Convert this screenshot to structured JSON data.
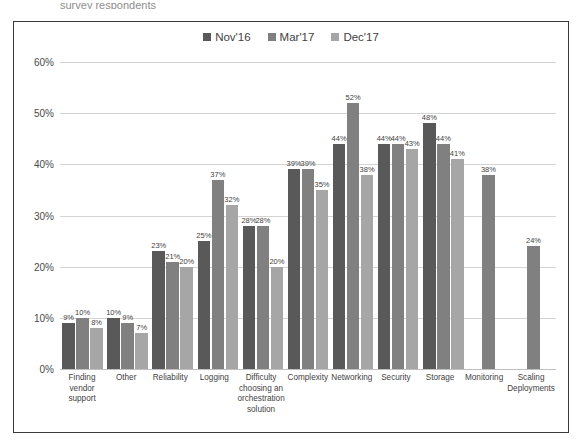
{
  "top_sliver_text": "survey respondents",
  "colors": {
    "nov16": "#595959",
    "mar17": "#808080",
    "dec17": "#a6a6a6",
    "grid": "#d4d4d4",
    "frame": "#3a3a3a",
    "text": "#3f3f3f"
  },
  "legend": {
    "items": [
      {
        "label": "Nov'16",
        "color": "#595959"
      },
      {
        "label": "Mar'17",
        "color": "#808080"
      },
      {
        "label": "Dec'17",
        "color": "#a6a6a6"
      }
    ]
  },
  "chart_data": {
    "type": "bar",
    "title": "",
    "xlabel": "",
    "ylabel": "",
    "ylim": [
      0,
      60
    ],
    "ytick_labels": [
      "0%",
      "10%",
      "20%",
      "30%",
      "40%",
      "50%",
      "60%"
    ],
    "ytick_values": [
      0,
      10,
      20,
      30,
      40,
      50,
      60
    ],
    "grid": true,
    "legend_position": "top-center",
    "value_suffix": "%",
    "categories": [
      "Finding vendor support",
      "Other",
      "Reliability",
      "Logging",
      "Difficulty choosing an orchestration solution",
      "Complexity",
      "Networking",
      "Security",
      "Storage",
      "Monitoring",
      "Scaling Deployments"
    ],
    "series": [
      {
        "name": "Nov'16",
        "color": "#595959",
        "values": [
          9,
          10,
          23,
          25,
          28,
          39,
          44,
          44,
          48,
          null,
          null
        ],
        "labels": [
          "9%",
          "10%",
          "23%",
          "25%",
          "28%",
          "39%",
          "44%",
          "44%",
          "48%",
          "",
          ""
        ]
      },
      {
        "name": "Mar'17",
        "color": "#808080",
        "values": [
          10,
          9,
          21,
          37,
          28,
          39,
          52,
          44,
          44,
          38,
          24
        ],
        "labels": [
          "10%",
          "9%",
          "21%",
          "37%",
          "28%",
          "39%",
          "52%",
          "44%",
          "44%",
          "38%",
          "24%"
        ]
      },
      {
        "name": "Dec'17",
        "color": "#a6a6a6",
        "values": [
          8,
          7,
          20,
          32,
          20,
          35,
          38,
          43,
          41,
          null,
          null
        ],
        "labels": [
          "8%",
          "7%",
          "20%",
          "32%",
          "20%",
          "35%",
          "38%",
          "43%",
          "41%",
          "",
          ""
        ]
      }
    ]
  }
}
